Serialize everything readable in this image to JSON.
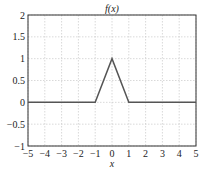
{
  "chart_data": {
    "type": "line",
    "title": "f(x)",
    "xlabel": "x",
    "ylabel": "",
    "xlim": [
      -5,
      5
    ],
    "ylim": [
      -1,
      2
    ],
    "xticks": [
      -5,
      -4,
      -3,
      -2,
      -1,
      0,
      1,
      2,
      3,
      4,
      5
    ],
    "xtick_labels": [
      "−5",
      "−4",
      "−3",
      "−2",
      "−1",
      "0",
      "1",
      "2",
      "3",
      "4",
      "5"
    ],
    "yticks": [
      -1,
      -0.5,
      0,
      0.5,
      1,
      1.5,
      2
    ],
    "ytick_labels": [
      "−1",
      "−0.5",
      "0",
      "0.5",
      "1",
      "1.5",
      "2"
    ],
    "grid": true,
    "legend": null,
    "series": [
      {
        "name": "f(x)",
        "x": [
          -5,
          -1,
          0,
          1,
          5
        ],
        "y": [
          0,
          0,
          1,
          0,
          0
        ],
        "color": "#555555"
      }
    ]
  },
  "colors": {
    "line": "#555555",
    "grid": "#c8c8c8",
    "axes": "#333333"
  }
}
